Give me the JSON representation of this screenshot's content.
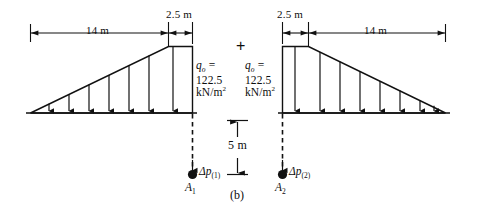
{
  "figure": {
    "caption": "(b)",
    "operator": "+",
    "left_diagram": {
      "dim_triangle": "14 m",
      "dim_rect": "2.5 m",
      "load_label": {
        "symbol": "q",
        "subscript": "o",
        "equals": "=",
        "value": "122.5",
        "unit": "kN/m",
        "unit_exponent": "2"
      },
      "point_label": "Δp",
      "point_subscript": "(1)",
      "point_name": "A",
      "point_name_subscript": "1",
      "arrow_count": 7
    },
    "right_diagram": {
      "dim_rect": "2.5 m",
      "dim_triangle": "14 m",
      "load_label": {
        "symbol": "q",
        "subscript": "o",
        "equals": "=",
        "value": "122.5",
        "unit": "kN/m",
        "unit_exponent": "2"
      },
      "point_label": "Δp",
      "point_subscript": "(2)",
      "point_name": "A",
      "point_name_subscript": "2",
      "arrow_count": 8
    },
    "depth_dimension": "5 m",
    "colors": {
      "line": "#111111",
      "background": "#ffffff"
    }
  }
}
